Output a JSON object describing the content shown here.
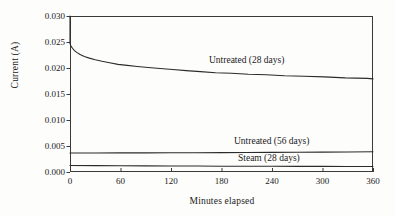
{
  "chart_data": {
    "type": "line",
    "title": "",
    "xlabel": "Minutes elapsed",
    "ylabel": "Current (A)",
    "xlim": [
      0,
      360
    ],
    "ylim": [
      0.0,
      0.03
    ],
    "xticks": [
      "0",
      "60",
      "120",
      "180",
      "240",
      "300",
      "360"
    ],
    "xtick_values": [
      0,
      60,
      120,
      180,
      240,
      300,
      360
    ],
    "yticks": [
      "0.000",
      "0.005",
      "0.010",
      "0.015",
      "0.020",
      "0.025",
      "0.030"
    ],
    "ytick_values": [
      0.0,
      0.005,
      0.01,
      0.015,
      0.02,
      0.025,
      0.03
    ],
    "grid": false,
    "legend_position": "inline-annotations",
    "line_color": "#2b2b2b",
    "axis_color": "#3a3a3a",
    "background": "#fdfdfc",
    "series": [
      {
        "name": "Untreated (28 days)",
        "x": [
          0,
          0,
          1,
          2,
          3,
          5,
          8,
          12,
          17,
          23,
          30,
          38,
          47,
          57,
          68,
          80,
          93,
          107,
          122,
          138,
          155,
          173,
          192,
          212,
          233,
          255,
          278,
          302,
          327,
          353,
          360
        ],
        "values": [
          0.03,
          0.0247,
          0.0243,
          0.024,
          0.0238,
          0.0234,
          0.023,
          0.0226,
          0.0222,
          0.0219,
          0.0216,
          0.0213,
          0.021,
          0.0207,
          0.0205,
          0.0203,
          0.0201,
          0.0199,
          0.0197,
          0.0195,
          0.0193,
          0.0191,
          0.019,
          0.0188,
          0.0187,
          0.0185,
          0.0184,
          0.0183,
          0.0181,
          0.018,
          0.0179
        ]
      },
      {
        "name": "Untreated (56 days)",
        "x": [
          0,
          30,
          60,
          90,
          120,
          150,
          180,
          210,
          240,
          270,
          300,
          330,
          360
        ],
        "values": [
          0.00365,
          0.00366,
          0.00367,
          0.00368,
          0.00369,
          0.00371,
          0.00373,
          0.00375,
          0.00377,
          0.00379,
          0.00382,
          0.00385,
          0.00389
        ]
      },
      {
        "name": "Steam (28 days)",
        "x": [
          0,
          30,
          60,
          90,
          120,
          150,
          180,
          210,
          240,
          270,
          300,
          330,
          360
        ],
        "values": [
          0.00125,
          0.00122,
          0.0012,
          0.00118,
          0.00116,
          0.00114,
          0.00112,
          0.00111,
          0.0011,
          0.00109,
          0.00108,
          0.00107,
          0.00106
        ]
      }
    ],
    "annotations": [
      {
        "text": "Untreated (28 days)",
        "x_px": 207,
        "y_px": 55
      },
      {
        "text": "Untreated (56 days)",
        "x_px": 232,
        "y_px": 136
      },
      {
        "text": "Steam (28 days)",
        "x_px": 236,
        "y_px": 153
      }
    ]
  }
}
